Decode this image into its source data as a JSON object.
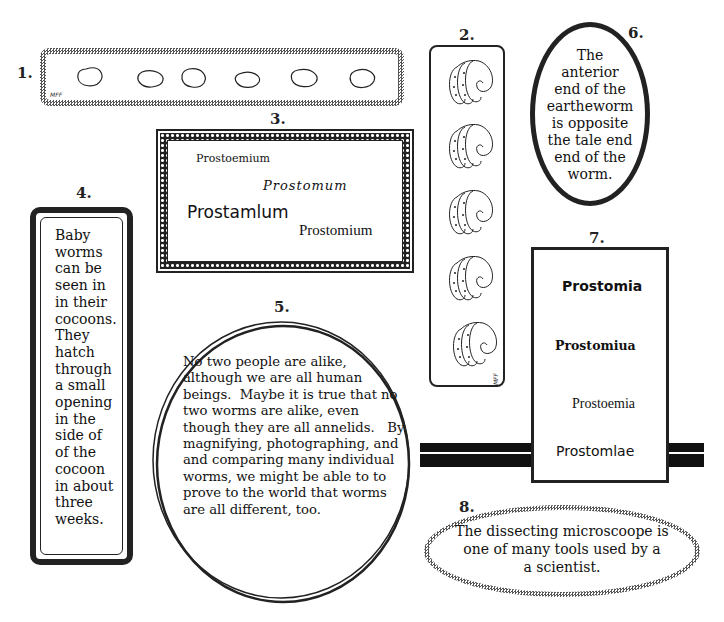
{
  "panels": {
    "p1": {
      "number": "1.",
      "signature": "MFF",
      "description": "Six earthworm cocoon outlines in a checkered rounded frame",
      "cocoon_count": 6
    },
    "p2": {
      "number": "2.",
      "signature": "MFF",
      "description": "Five earthworm anterior-end sketches in a tall rounded frame",
      "sketch_count": 5
    },
    "p3": {
      "number": "3.",
      "words": [
        "Prostoemium",
        "Prostomum",
        "Prostamlum",
        "Prostomium"
      ]
    },
    "p4": {
      "number": "4.",
      "lines": [
        "Baby",
        "worms",
        "can be",
        "seen in",
        "in their",
        "cocoons.",
        "They",
        "hatch",
        "through",
        "a small",
        "opening",
        "in the",
        "side of",
        "of the",
        "cocoon",
        "in about",
        "three",
        "weeks."
      ]
    },
    "p5": {
      "number": "5.",
      "text": "No two people are alike,\nalthough we are all human\nbeings.  Maybe it is true that no\ntwo worms are alike, even\nthough they are all annelids.   By\nmagnifying, photographing, and\nand comparing many individual\nworms, we might be able to to\nprove to the world that worms\nare all different, too."
    },
    "p6": {
      "number": "6.",
      "lines": [
        "The",
        "anterior",
        "end of the",
        "eartheworm",
        "is opposite",
        "the tale end",
        "end of the",
        "worm."
      ]
    },
    "p7": {
      "number": "7.",
      "words": [
        "Prostomia",
        "Prostomiua",
        "Prostoemia",
        "Prostomlae"
      ]
    },
    "p8": {
      "number": "8.",
      "lines": [
        "The dissecting microscoope is",
        "one of many tools used by a",
        "a scientist."
      ]
    }
  },
  "colors": {
    "ink": "#222222",
    "background": "#ffffff"
  }
}
